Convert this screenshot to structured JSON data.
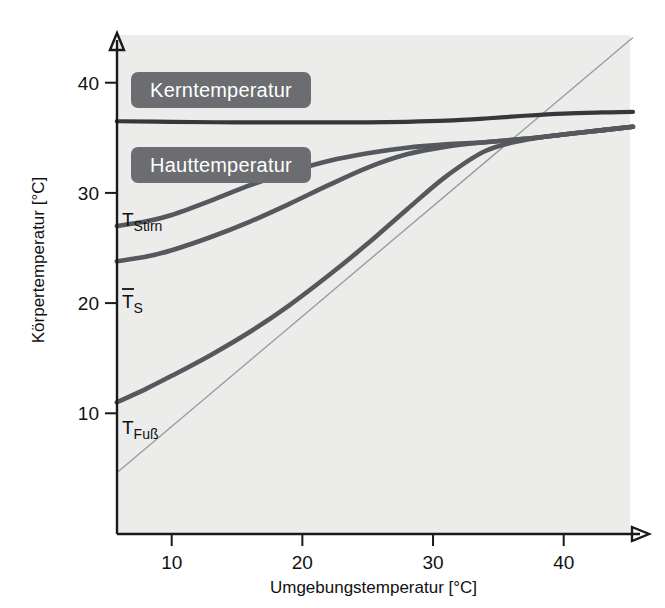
{
  "chart_data": {
    "type": "line",
    "title": "",
    "xlabel": "Umgebungstemperatur [°C]",
    "ylabel": "Körpertemperatur [°C]",
    "xlim": [
      5.8,
      45.3
    ],
    "ylim": [
      4.5,
      43.5
    ],
    "xticks": [
      10,
      20,
      30,
      40
    ],
    "yticks": [
      10,
      20,
      30,
      40
    ],
    "xtick_labels": [
      "10",
      "20",
      "30",
      "40"
    ],
    "ytick_labels": [
      "10",
      "20",
      "30",
      "40"
    ],
    "grid": false,
    "legend_position": "inside-upper-left",
    "annotations": [
      {
        "name": "kerntemperatur-box",
        "text": "Kerntemperatur",
        "kind": "label-box"
      },
      {
        "name": "hauttemperatur-box",
        "text": "Hauttemperatur",
        "kind": "label-box"
      },
      {
        "name": "t-stirn-label",
        "text": "TStirn",
        "base": "T",
        "sub": "Stirn",
        "kind": "curve-label"
      },
      {
        "name": "t-s-mean-label",
        "text": "T̄S",
        "base": "T",
        "sub": "S",
        "overbar": true,
        "kind": "curve-label"
      },
      {
        "name": "t-fuss-label",
        "text": "TFuß",
        "base": "T",
        "sub": "Fuß",
        "kind": "curve-label"
      }
    ],
    "series": [
      {
        "name": "Kerntemperatur",
        "label": "Kerntemperatur",
        "color": "#35373a",
        "x": [
          5.8,
          10,
          15,
          20,
          25,
          28,
          31,
          34,
          37,
          40,
          43,
          45.3
        ],
        "y": [
          36.5,
          36.45,
          36.4,
          36.4,
          36.4,
          36.45,
          36.55,
          36.75,
          37.0,
          37.2,
          37.3,
          37.35
        ]
      },
      {
        "name": "T_Stirn",
        "label": "TStirn",
        "color": "#55585c",
        "x": [
          5.8,
          8,
          10,
          13,
          16,
          19,
          22,
          25,
          28,
          31,
          34,
          37,
          40,
          43,
          45.3
        ],
        "y": [
          27.0,
          27.4,
          28.0,
          29.3,
          30.7,
          31.9,
          32.9,
          33.6,
          34.1,
          34.4,
          34.6,
          34.9,
          35.3,
          35.7,
          36.0
        ]
      },
      {
        "name": "T_S_mittel",
        "label": "T̄S",
        "color": "#55585c",
        "x": [
          5.8,
          8,
          10,
          13,
          16,
          19,
          22,
          25,
          28,
          31,
          34,
          37,
          40,
          43,
          45.3
        ],
        "y": [
          23.8,
          24.2,
          24.8,
          26.0,
          27.4,
          29.0,
          30.7,
          32.3,
          33.5,
          34.2,
          34.6,
          34.9,
          35.3,
          35.7,
          36.0
        ]
      },
      {
        "name": "T_Fuss",
        "label": "TFuß",
        "color": "#55585c",
        "x": [
          5.8,
          8,
          10,
          13,
          16,
          19,
          22,
          25,
          28,
          31,
          34,
          37,
          40,
          43,
          45.3
        ],
        "y": [
          11.0,
          12.2,
          13.4,
          15.3,
          17.4,
          19.8,
          22.5,
          25.4,
          28.5,
          31.5,
          33.8,
          34.8,
          35.3,
          35.7,
          36.0
        ]
      },
      {
        "name": "Identitaetslinie",
        "label": "",
        "color": "#9a9ca0",
        "x": [
          5.8,
          45.3
        ],
        "y": [
          4.6,
          44.1
        ]
      }
    ]
  },
  "chart": {
    "xlabel": "Umgebungstemperatur [°C]",
    "ylabel": "Körpertemperatur [°C]",
    "legend": {
      "core_label": "Kerntemperatur",
      "skin_label": "Hauttemperatur"
    },
    "curve_labels": {
      "stirn_base": "T",
      "stirn_sub": "Stirn",
      "smean_base": "T",
      "smean_sub": "S",
      "fuss_base": "T",
      "fuss_sub": "Fuß"
    },
    "xticks": [
      "10",
      "20",
      "30",
      "40"
    ],
    "yticks": [
      "40",
      "30",
      "20",
      "10"
    ],
    "colors": {
      "plot_background": "#ececeb",
      "core_curve": "#35373a",
      "skin_curve": "#55585c",
      "identity_line": "#9a9ca0",
      "legend_box": "#6b6d70",
      "axis": "#1a1a1a"
    }
  }
}
